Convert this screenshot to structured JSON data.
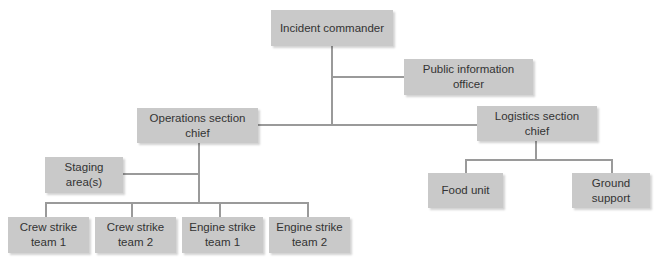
{
  "diagram": {
    "type": "org-chart",
    "title": "",
    "colors": {
      "box_fill": "#c9c9c9",
      "line": "#9a9a9a",
      "text": "#333333",
      "background": "#ffffff"
    },
    "nodes": {
      "incident_commander": "Incident commander",
      "public_information_officer": "Public information\nofficer",
      "operations_section_chief": "Operations section\nchief",
      "logistics_section_chief": "Logistics section\nchief",
      "staging_areas": "Staging\narea(s)",
      "crew_strike_team_1": "Crew strike\nteam 1",
      "crew_strike_team_2": "Crew strike\nteam 2",
      "engine_strike_team_1": "Engine strike\nteam 1",
      "engine_strike_team_2": "Engine strike\nteam 2",
      "food_unit": "Food unit",
      "ground_support": "Ground\nsupport"
    },
    "edges": [
      [
        "Incident commander",
        "Public information officer"
      ],
      [
        "Incident commander",
        "Operations section chief"
      ],
      [
        "Incident commander",
        "Logistics section chief"
      ],
      [
        "Operations section chief",
        "Staging area(s)"
      ],
      [
        "Operations section chief",
        "Crew strike team 1"
      ],
      [
        "Operations section chief",
        "Crew strike team 2"
      ],
      [
        "Operations section chief",
        "Engine strike team 1"
      ],
      [
        "Operations section chief",
        "Engine strike team 2"
      ],
      [
        "Logistics section chief",
        "Food unit"
      ],
      [
        "Logistics section chief",
        "Ground support"
      ]
    ]
  }
}
